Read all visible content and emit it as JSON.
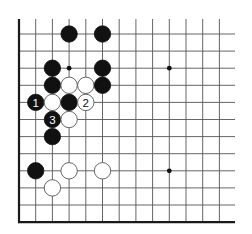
{
  "diagram": {
    "type": "go-board-diagram",
    "grid": {
      "columns_visible": 13,
      "rows_visible": 12,
      "left_edge": "board-edge",
      "bottom_edge": "board-edge",
      "top_edge": "open",
      "right_edge": "open",
      "origin_x": 19,
      "origin_y": 34,
      "col_spacing": 16.7,
      "row_spacing": 17.1,
      "top_extent_y": 19,
      "right_extent_x": 235
    },
    "colors": {
      "black_stone": "#111111",
      "white_stone": "#ffffff",
      "white_outline": "#555555",
      "grid": "#555555",
      "edge": "#1a1a1a",
      "background": "#ffffff"
    },
    "star_points": [
      {
        "col": 3,
        "row": 2
      },
      {
        "col": 9,
        "row": 2
      },
      {
        "col": 9,
        "row": 8
      }
    ],
    "stones": [
      {
        "color": "black",
        "col": 3,
        "row": 0,
        "label": ""
      },
      {
        "color": "black",
        "col": 5,
        "row": 0,
        "label": ""
      },
      {
        "color": "black",
        "col": 2,
        "row": 2,
        "label": ""
      },
      {
        "color": "black",
        "col": 5,
        "row": 2,
        "label": ""
      },
      {
        "color": "black",
        "col": 2,
        "row": 3,
        "label": ""
      },
      {
        "color": "white",
        "col": 3,
        "row": 3,
        "label": ""
      },
      {
        "color": "white",
        "col": 4,
        "row": 3,
        "label": ""
      },
      {
        "color": "black",
        "col": 5,
        "row": 3,
        "label": ""
      },
      {
        "color": "black",
        "col": 1,
        "row": 4,
        "label": "1"
      },
      {
        "color": "white",
        "col": 2,
        "row": 4,
        "label": ""
      },
      {
        "color": "black",
        "col": 3,
        "row": 4,
        "label": ""
      },
      {
        "color": "white",
        "col": 4,
        "row": 4,
        "label": "2"
      },
      {
        "color": "black",
        "col": 2,
        "row": 5,
        "label": "3"
      },
      {
        "color": "white",
        "col": 3,
        "row": 5,
        "label": ""
      },
      {
        "color": "black",
        "col": 2,
        "row": 6,
        "label": ""
      },
      {
        "color": "black",
        "col": 1,
        "row": 8,
        "label": ""
      },
      {
        "color": "white",
        "col": 3,
        "row": 8,
        "label": ""
      },
      {
        "color": "white",
        "col": 5,
        "row": 8,
        "label": ""
      },
      {
        "color": "white",
        "col": 2,
        "row": 9,
        "label": ""
      }
    ],
    "move_labels": [
      "1",
      "2",
      "3"
    ]
  }
}
